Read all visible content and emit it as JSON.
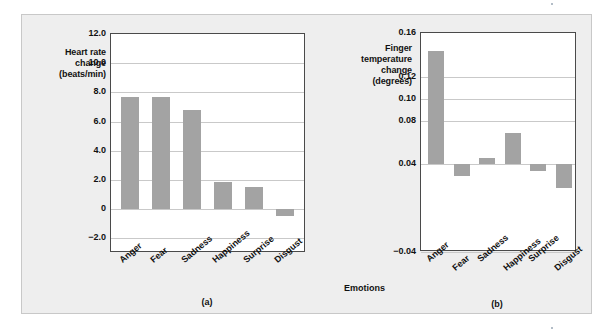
{
  "figure": {
    "background_color": "#eeeeee",
    "bar_color": "#a3a3a3",
    "gridline_color": "#c9c9c9",
    "frame_color": "#4a4a4a",
    "xaxis_label": "Emotions",
    "caption_a": "(a)",
    "caption_b": "(b)"
  },
  "chart_data": [
    {
      "type": "bar",
      "panel": "(a)",
      "title": "",
      "ylabel": "Heart rate change (beats/min)",
      "ylabel_lines": [
        "Heart rate",
        "change",
        "(beats/min)"
      ],
      "xlabel": "Emotions",
      "categories": [
        "Anger",
        "Fear",
        "Sadness",
        "Happiness",
        "Surprise",
        "Disgust"
      ],
      "values": [
        7.7,
        7.7,
        6.8,
        1.85,
        1.5,
        -0.45
      ],
      "yticks": [
        "12.0",
        "10.0",
        "8.0",
        "6.0",
        "4.0",
        "2.0",
        "0",
        "-2.0"
      ],
      "ytick_values": [
        12.0,
        10.0,
        8.0,
        6.0,
        4.0,
        2.0,
        0,
        -2.0
      ],
      "ylim": [
        -3.0,
        12.0
      ],
      "baseline": 0,
      "grid": true,
      "legend": "none"
    },
    {
      "type": "bar",
      "panel": "(b)",
      "title": "",
      "ylabel": "Finger temperature change (degrees)",
      "ylabel_lines": [
        "Finger",
        "temperature",
        "change",
        "(degrees)"
      ],
      "xlabel": "Emotions",
      "categories": [
        "Anger",
        "Fear",
        "Sadness",
        "Happiness",
        "Surprise",
        "Disgust"
      ],
      "values": [
        0.144,
        0.029,
        0.046,
        0.069,
        0.034,
        0.018
      ],
      "yticks": [
        "0.16",
        "0.12",
        "0.10",
        "0.08",
        "0.04",
        "-0.04"
      ],
      "ytick_values": [
        0.16,
        0.12,
        0.1,
        0.08,
        0.04,
        -0.04
      ],
      "ylim": [
        -0.04,
        0.16
      ],
      "baseline": 0.04,
      "grid": true,
      "legend": "none"
    }
  ]
}
